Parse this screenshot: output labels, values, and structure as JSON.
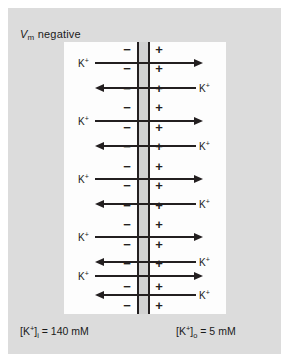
{
  "figure": {
    "title_prefix": "V",
    "title_sub": "m",
    "title_suffix": " negative",
    "title_full": "Vm negative",
    "background_color": "#ffffff",
    "panel_color": "#dcdcdc",
    "cell_color": "#fdfdfd",
    "membrane_color": "#231f20",
    "membrane_band_color": "#d2d2d2",
    "ink_color": "#231f20"
  },
  "membrane": {
    "inside_charge": "−",
    "outside_charge": "+",
    "inside_charge_name": "minus",
    "outside_charge_name": "plus",
    "charge_rows": 14,
    "charge_y": [
      49,
      68,
      88,
      107,
      127,
      146,
      166,
      185,
      205,
      224,
      244,
      263,
      286,
      305
    ]
  },
  "ion": {
    "label": "K",
    "charge_sup": "+"
  },
  "arrows": [
    {
      "direction": "right",
      "y": 63,
      "label_side": "left",
      "name": "k-efflux-arrow-1"
    },
    {
      "direction": "left",
      "y": 88,
      "label_side": "right",
      "name": "k-influx-arrow-1"
    },
    {
      "direction": "right",
      "y": 121,
      "label_side": "left",
      "name": "k-efflux-arrow-2"
    },
    {
      "direction": "left",
      "y": 146,
      "label_side": "right",
      "name": "k-influx-arrow-2"
    },
    {
      "direction": "right",
      "y": 179,
      "label_side": "left",
      "name": "k-efflux-arrow-3"
    },
    {
      "direction": "left",
      "y": 204,
      "label_side": "right",
      "name": "k-influx-arrow-3"
    },
    {
      "direction": "right",
      "y": 237,
      "label_side": "left",
      "name": "k-efflux-arrow-4"
    },
    {
      "direction": "left",
      "y": 262,
      "label_side": "right",
      "name": "k-influx-arrow-4"
    },
    {
      "direction": "right",
      "y": 276,
      "label_side": "left",
      "name": "k-efflux-arrow-5"
    },
    {
      "direction": "left",
      "y": 295,
      "label_side": "right",
      "name": "k-influx-arrow-5"
    }
  ],
  "concentrations": {
    "inside": {
      "bracket_open": "[K",
      "sup": "+",
      "bracket_close": "]",
      "sub": "i",
      "value": " = 140 mM",
      "full": "[K+]i = 140 mM"
    },
    "outside": {
      "bracket_open": "[K",
      "sup": "+",
      "bracket_close": "]",
      "sub": "o",
      "value": " = 5 mM",
      "full": "[K+]o = 5 mM"
    }
  }
}
